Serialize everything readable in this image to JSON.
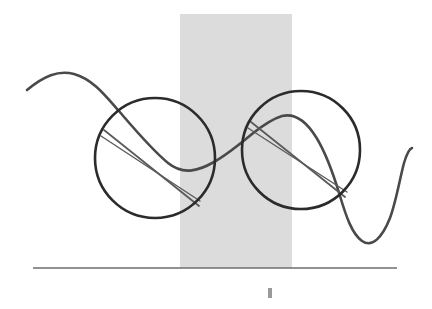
{
  "canvas": {
    "width": 432,
    "height": 309,
    "background_color": "#ffffff",
    "title": "Rolling circles on a sinusoidal curve with chord lines"
  },
  "colors": {
    "stroke_dark": "#2b2b2b",
    "stroke_curve": "#4a4a4a",
    "stroke_chord": "#5a5a5a",
    "band_gray": "#dcdcdc",
    "baseline_gray": "#6e6e6e",
    "tick_gray": "#9a9a9a"
  },
  "shapes": {
    "band": {
      "name": "vertical gray band",
      "x": 180,
      "y": 14,
      "width": 112,
      "height": 254,
      "fill": "#dcdcdc"
    },
    "baseline": {
      "name": "horizontal baseline",
      "x1": 33,
      "y1": 268,
      "x2": 397,
      "y2": 268,
      "stroke": "#6e6e6e",
      "stroke_width": 1.6
    },
    "tick_mark": {
      "name": "small bottom tick mark",
      "x": 268,
      "y": 288,
      "width": 4,
      "height": 10,
      "fill": "#9a9a9a"
    },
    "circle_left": {
      "name": "left circle",
      "cx": 155,
      "cy": 158,
      "r": 60,
      "stroke": "#2b2b2b",
      "stroke_width": 2.6
    },
    "circle_right": {
      "name": "right circle",
      "cx": 301,
      "cy": 150,
      "r": 59,
      "stroke": "#2b2b2b",
      "stroke_width": 2.6
    },
    "wave_curve": {
      "name": "sinusoidal curve",
      "path": "M 27 90 C 44 76, 58 70, 74 74 C 92 79, 104 94, 118 110 C 132 126, 150 148, 168 163 C 184 176, 200 170, 214 162 C 228 154, 240 144, 252 134 C 262 126, 272 119, 282 116 C 294 113, 306 121, 316 137 C 326 153, 334 176, 340 196 C 346 216, 352 234, 362 241 C 372 248, 382 238, 390 218 C 396 202, 400 178, 404 163 C 407 153, 409 149, 412 148",
      "stroke": "#4a4a4a",
      "stroke_width": 2.6
    },
    "chord_left": {
      "name": "left circle chord",
      "x1": 104,
      "y1": 130,
      "x2": 199,
      "y2": 206,
      "stroke": "#5a5a5a",
      "stroke_width": 1.8
    },
    "chord_right": {
      "name": "right circle chord",
      "x1": 251,
      "y1": 122,
      "x2": 345,
      "y2": 197,
      "stroke": "#5a5a5a",
      "stroke_width": 1.8
    },
    "secant_left": {
      "name": "left circle secant",
      "x1": 101,
      "y1": 136,
      "x2": 200,
      "y2": 201,
      "stroke": "#5a5a5a",
      "stroke_width": 1.4
    },
    "secant_right": {
      "name": "right circle secant",
      "x1": 248,
      "y1": 128,
      "x2": 347,
      "y2": 192,
      "stroke": "#5a5a5a",
      "stroke_width": 1.4
    }
  },
  "chart_data": {
    "type": "line",
    "title": "",
    "xlabel": "",
    "ylabel": "",
    "grid": false,
    "legend": "none",
    "annotations": [
      "left circle tangent to curve",
      "right circle tangent to curve",
      "gray vertical band region",
      "baseline axis"
    ],
    "series": [
      {
        "name": "wave",
        "points": [
          [
            27,
            90
          ],
          [
            50,
            75
          ],
          [
            74,
            74
          ],
          [
            100,
            90
          ],
          [
            126,
            118
          ],
          [
            152,
            148
          ],
          [
            168,
            163
          ],
          [
            190,
            168
          ],
          [
            214,
            162
          ],
          [
            240,
            144
          ],
          [
            262,
            126
          ],
          [
            282,
            116
          ],
          [
            300,
            124
          ],
          [
            318,
            142
          ],
          [
            334,
            176
          ],
          [
            350,
            222
          ],
          [
            362,
            241
          ],
          [
            378,
            238
          ],
          [
            390,
            218
          ],
          [
            402,
            170
          ],
          [
            412,
            148
          ]
        ]
      }
    ]
  }
}
